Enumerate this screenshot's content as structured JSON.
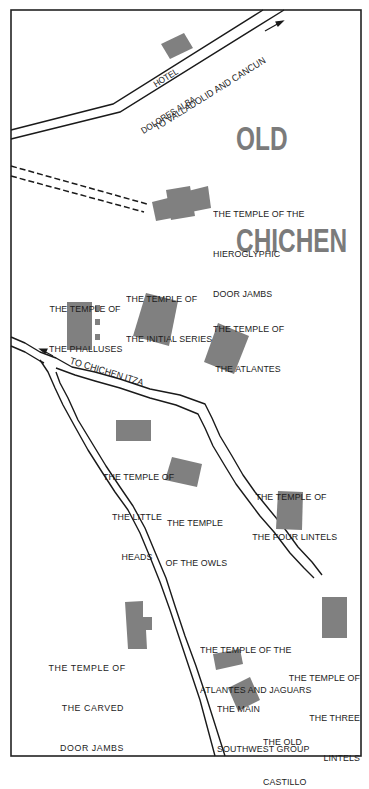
{
  "map": {
    "title_lines": [
      "OLD",
      "CHICHEN"
    ],
    "colors": {
      "background": "#ffffff",
      "border": "#222222",
      "road": "#1a1a1a",
      "building": "#7f7f7f",
      "title": "#7b7b7b",
      "label": "#1c1c1c"
    },
    "roads": [
      {
        "id": "road-valladolid-cancun",
        "label": "TO VALLADOLID AND CANCUN",
        "arrow": "northeast"
      },
      {
        "id": "road-chichen-itza",
        "label": "TO CHICHEN ITZA",
        "arrow": "northwest"
      },
      {
        "id": "path-dashed",
        "label": ""
      },
      {
        "id": "road-southwest",
        "label": ""
      },
      {
        "id": "road-east-loop",
        "label": ""
      }
    ],
    "landmarks": [
      {
        "id": "hotel-dolores-alba",
        "lines": [
          "HOTEL",
          "DOLORES ALBA"
        ]
      },
      {
        "id": "temple-hieroglyphic-door-jambs",
        "lines": [
          "THE TEMPLE OF THE",
          "HIEROGLYPHIC",
          "DOOR JAMBS"
        ]
      },
      {
        "id": "temple-phalluses",
        "lines": [
          "THE TEMPLE OF",
          "THE PHALLUSES"
        ]
      },
      {
        "id": "temple-initial-series",
        "lines": [
          "THE TEMPLE OF",
          "THE INITIAL SERIES"
        ]
      },
      {
        "id": "temple-atlantes",
        "lines": [
          "THE TEMPLE OF",
          "THE ATLANTES"
        ]
      },
      {
        "id": "temple-little-heads",
        "lines": [
          "THE TEMPLE OF",
          "THE LITTLE",
          "HEADS"
        ]
      },
      {
        "id": "temple-owls",
        "lines": [
          "THE TEMPLE",
          "OF THE OWLS"
        ]
      },
      {
        "id": "temple-four-lintels",
        "lines": [
          "THE TEMPLE OF",
          "THE FOUR LINTELS"
        ]
      },
      {
        "id": "temple-atlantes-jaguars",
        "lines": [
          "THE TEMPLE OF THE",
          "ATLANTES AND JAGUARS"
        ]
      },
      {
        "id": "temple-three-lintels",
        "lines": [
          "THE TEMPLE OF",
          "THE THREE",
          "LINTELS"
        ]
      },
      {
        "id": "temple-carved-door-jambs",
        "lines": [
          "THE TEMPLE OF",
          "THE CARVED",
          "DOOR JAMBS"
        ]
      },
      {
        "id": "main-southwest-group",
        "lines": [
          "THE MAIN",
          "SOUTHWEST GROUP"
        ]
      },
      {
        "id": "old-castillo",
        "lines": [
          "THE OLD",
          "CASTILLO"
        ]
      }
    ]
  }
}
